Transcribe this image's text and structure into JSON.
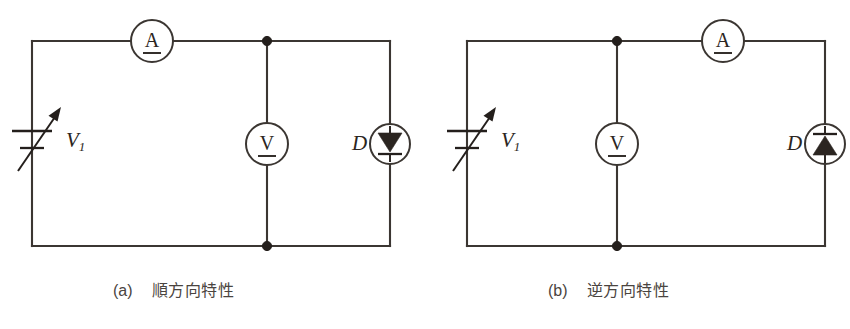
{
  "figure": {
    "type": "circuit-diagram",
    "background_color": "#ffffff",
    "wire_color": "#3b3632",
    "symbol_color": "#241f1c",
    "caption_color": "#4a4440"
  },
  "panels": [
    {
      "id": "panel-a",
      "caption_tag": "(a)",
      "caption_text": "順方向特性",
      "source": {
        "label": "V",
        "label_subscript": "1",
        "symbol": "variable-dc-source"
      },
      "ammeter": {
        "glyph": "A",
        "symbol": "dc-ammeter",
        "position": "top-wire-left-of-node"
      },
      "voltmeter": {
        "glyph": "V",
        "symbol": "dc-voltmeter",
        "position": "center-shunt-branch"
      },
      "diode": {
        "label": "D",
        "symbol": "diode-in-circle",
        "orientation": "cathode-down",
        "triangle_direction": "down"
      },
      "nodes": [
        "top-center-junction",
        "bottom-center-junction"
      ]
    },
    {
      "id": "panel-b",
      "caption_tag": "(b)",
      "caption_text": "逆方向特性",
      "source": {
        "label": "V",
        "label_subscript": "1",
        "symbol": "variable-dc-source"
      },
      "ammeter": {
        "glyph": "A",
        "symbol": "dc-ammeter",
        "position": "top-wire-right-of-node"
      },
      "voltmeter": {
        "glyph": "V",
        "symbol": "dc-voltmeter",
        "position": "center-shunt-branch"
      },
      "diode": {
        "label": "D",
        "symbol": "diode-in-circle",
        "orientation": "cathode-up",
        "triangle_direction": "up"
      },
      "nodes": [
        "top-center-junction",
        "bottom-center-junction"
      ]
    }
  ]
}
